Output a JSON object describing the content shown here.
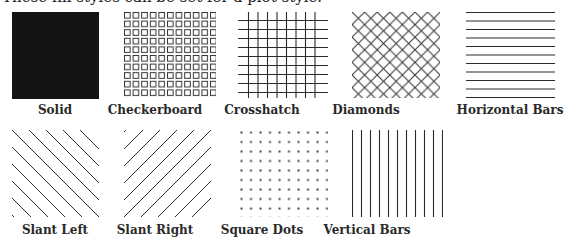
{
  "intro_text": "These fill styles can be set for a plot style.",
  "colors": {
    "ink": "#1a1a1a",
    "background": "#ffffff"
  },
  "fill_styles": [
    {
      "id": "solid",
      "label": "Solid",
      "icon": "solid-fill-icon"
    },
    {
      "id": "checkerboard",
      "label": "Checkerboard",
      "icon": "checkerboard-fill-icon"
    },
    {
      "id": "crosshatch",
      "label": "Crosshatch",
      "icon": "crosshatch-fill-icon"
    },
    {
      "id": "diamonds",
      "label": "Diamonds",
      "icon": "diamonds-fill-icon"
    },
    {
      "id": "horizontal-bars",
      "label": "Horizontal Bars",
      "icon": "horizontal-bars-fill-icon"
    },
    {
      "id": "slant-left",
      "label": "Slant Left",
      "icon": "slant-left-fill-icon"
    },
    {
      "id": "slant-right",
      "label": "Slant Right",
      "icon": "slant-right-fill-icon"
    },
    {
      "id": "square-dots",
      "label": "Square Dots",
      "icon": "square-dots-fill-icon"
    },
    {
      "id": "vertical-bars",
      "label": "Vertical Bars",
      "icon": "vertical-bars-fill-icon"
    }
  ]
}
